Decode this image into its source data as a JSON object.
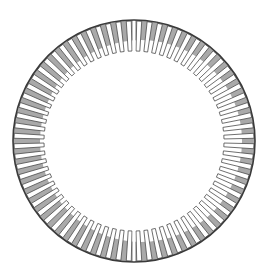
{
  "diagram": {
    "center": [
      134,
      141
    ],
    "outer_radius": 121,
    "tooth_inner_radius": 90,
    "shade_inner_center": [
      141,
      141
    ],
    "shade_inner_radius": 101,
    "tooth_count": 72,
    "tooth_width_deg": 2.4,
    "split_angles_deg": [
      0,
      180
    ],
    "colors": {
      "background": "#ffffff",
      "shade": "#a9a9a9",
      "outline": "#4a4a4a",
      "rim": "#3a3a3a"
    }
  }
}
